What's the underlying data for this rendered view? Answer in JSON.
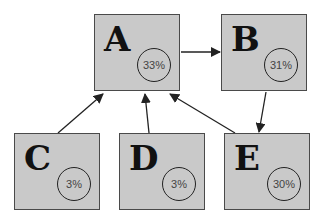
{
  "nodes": [
    {
      "id": "A",
      "label": "A",
      "percent": "33%"
    },
    {
      "id": "B",
      "label": "B",
      "percent": "31%"
    },
    {
      "id": "C",
      "label": "C",
      "percent": "3%"
    },
    {
      "id": "D",
      "label": "D",
      "percent": "3%"
    },
    {
      "id": "E",
      "label": "E",
      "percent": "30%"
    }
  ],
  "edges": [
    {
      "from": "A",
      "to": "B"
    },
    {
      "from": "B",
      "to": "E"
    },
    {
      "from": "C",
      "to": "A"
    },
    {
      "from": "D",
      "to": "A"
    },
    {
      "from": "E",
      "to": "A"
    }
  ],
  "colors": {
    "node_fill": "#c9c9c9",
    "node_border": "#4a4a4a",
    "edge": "#222222"
  }
}
